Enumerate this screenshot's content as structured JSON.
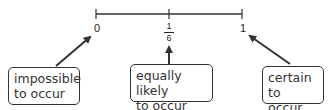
{
  "number_line": {
    "ticks": [
      {
        "label": "0",
        "position": 0
      },
      {
        "label_numerator": "1",
        "label_denominator": "6",
        "position": 0.5
      },
      {
        "label": "1",
        "position": 1
      }
    ]
  },
  "callouts": [
    {
      "line1": "impossible",
      "line2": "to occur",
      "points_to": "0"
    },
    {
      "line1": "equally likely",
      "line2": "to occur",
      "points_to": "1/6"
    },
    {
      "line1": "certain to",
      "line2": "occur",
      "points_to": "1"
    }
  ],
  "colors": {
    "line": "#333333",
    "arrow": "#333333",
    "text": "#333333"
  }
}
